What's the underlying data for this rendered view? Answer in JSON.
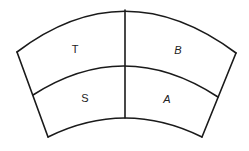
{
  "diagram": {
    "type": "choir-seating-arc",
    "line_color": "#1a1a1a",
    "background": "#ffffff",
    "sections": [
      {
        "id": "T",
        "label": "T",
        "row": "back",
        "side": "left"
      },
      {
        "id": "B",
        "label": "B",
        "row": "back",
        "side": "right"
      },
      {
        "id": "S",
        "label": "S",
        "row": "front",
        "side": "left"
      },
      {
        "id": "A",
        "label": "A",
        "row": "front",
        "side": "right"
      }
    ]
  }
}
